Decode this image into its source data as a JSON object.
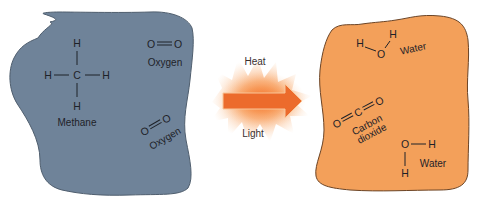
{
  "colors": {
    "reactants_fill": "#6f8399",
    "products_fill": "#f3a05a",
    "arrow_fill": "#ec6b2c",
    "glow": "#f7a15c",
    "text": "#1e2228"
  },
  "reactants": {
    "methane": {
      "atoms": {
        "top": "H",
        "left": "H",
        "center": "C",
        "right": "H",
        "bottom": "H"
      },
      "label": "Methane"
    },
    "oxygen_1": {
      "atom_a": "O",
      "atom_b": "O",
      "label": "Oxygen"
    },
    "oxygen_2": {
      "atom_a": "O",
      "atom_b": "O",
      "label": "Oxygen"
    }
  },
  "reaction": {
    "energy_top": "Heat",
    "energy_bottom": "Light"
  },
  "products": {
    "water_1": {
      "h_left": "H",
      "o": "O",
      "h_right": "H",
      "label": "Water"
    },
    "carbon_dioxide": {
      "o_left": "O",
      "c": "C",
      "o_right": "O",
      "label_line1": "Carbon",
      "label_line2": "dioxide"
    },
    "water_2": {
      "o": "O",
      "h_right": "H",
      "h_bottom": "H",
      "label": "Water"
    }
  }
}
